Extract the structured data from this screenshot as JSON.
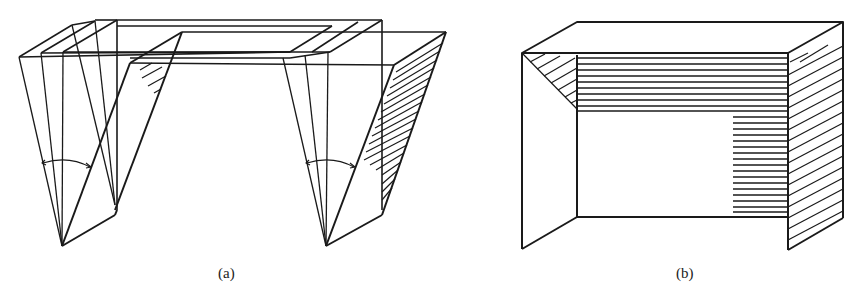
{
  "figure": {
    "panels": [
      {
        "id": "a",
        "label": "(a)",
        "description": "Folded frame with wedge-shaped leg plates swung through an angle, shown in multiple positions"
      },
      {
        "id": "b",
        "label": "(b)",
        "description": "Box-shaped frame with hatched top, side and back faces"
      }
    ]
  },
  "colors": {
    "stroke": "#1a1a1a",
    "background": "#ffffff"
  }
}
